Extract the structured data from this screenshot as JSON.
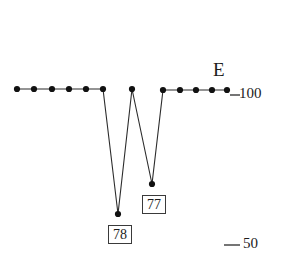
{
  "figure": {
    "series_label": "E",
    "value_boxes": [
      {
        "name": "deep-minimum",
        "text": "78"
      },
      {
        "name": "secondary-minimum",
        "text": "77"
      }
    ],
    "ticks": [
      {
        "name": "tick-100",
        "text": "100"
      },
      {
        "name": "tick-50",
        "text": "50"
      }
    ],
    "colors": {
      "line": "#2b2b2b",
      "marker": "#111111",
      "tick": "#2b2b2b",
      "box_border": "#3a3a3a",
      "text": "#1c1c1c",
      "background": "#ffffff"
    }
  },
  "chart_data": {
    "type": "line",
    "title": "",
    "xlabel": "",
    "ylabel": "",
    "ylim": [
      50,
      100
    ],
    "grid": false,
    "legend_position": "right-top",
    "series": [
      {
        "name": "E",
        "x": [
          0,
          1,
          2,
          3,
          4,
          5,
          6,
          7,
          8,
          9,
          10,
          11,
          12,
          13,
          14
        ],
        "values": [
          100,
          100,
          100,
          100,
          100,
          100,
          78,
          100,
          77,
          100,
          100,
          100,
          100,
          100,
          100
        ]
      }
    ],
    "annotations": [
      {
        "text": "78",
        "x": 6,
        "y": 78,
        "style": "boxed"
      },
      {
        "text": "77",
        "x": 8,
        "y": 77,
        "style": "boxed"
      },
      {
        "text": "E",
        "x": 13.4,
        "y": 104,
        "style": "plain"
      }
    ],
    "yticks": [
      {
        "value": 100,
        "label": "100"
      },
      {
        "value": 50,
        "label": "50"
      }
    ]
  },
  "geometry": {
    "points_px": [
      [
        17,
        89
      ],
      [
        34,
        89
      ],
      [
        52,
        89
      ],
      [
        69,
        89
      ],
      [
        86,
        89
      ],
      [
        103,
        89
      ],
      [
        118,
        214
      ],
      [
        132,
        89
      ],
      [
        152,
        184
      ],
      [
        163,
        90
      ],
      [
        180,
        90
      ],
      [
        196,
        90
      ],
      [
        212,
        90
      ],
      [
        227,
        90
      ]
    ],
    "markers_px": [
      [
        17,
        89
      ],
      [
        34,
        89
      ],
      [
        52,
        89
      ],
      [
        69,
        89
      ],
      [
        86,
        89
      ],
      [
        103,
        89
      ],
      [
        118,
        214
      ],
      [
        132,
        89
      ],
      [
        152,
        184
      ],
      [
        163,
        90
      ],
      [
        180,
        90
      ],
      [
        196,
        90
      ],
      [
        212,
        90
      ],
      [
        227,
        90
      ]
    ],
    "tick_100_px": {
      "x1": 230,
      "x2": 240,
      "y": 95
    },
    "tick_50_px": {
      "x1": 224,
      "x2": 240,
      "y": 245
    },
    "viewbox": "0 0 285 276"
  }
}
